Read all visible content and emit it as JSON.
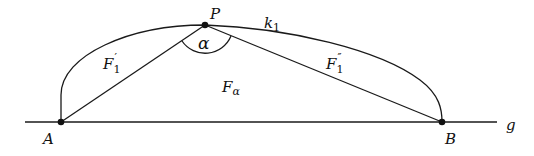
{
  "diagram": {
    "points": {
      "A": "A",
      "B": "B",
      "P": "P"
    },
    "line_label": "g",
    "curve_label": {
      "base": "k",
      "sub": "1"
    },
    "angle_label": "α",
    "area_label": {
      "base": "F",
      "sub": "α"
    },
    "segment_left_label": {
      "base": "F",
      "sub": "1",
      "sup": "′"
    },
    "segment_right_label": {
      "base": "F",
      "sub": "1",
      "sup": "″"
    },
    "colors": {
      "stroke": "#1a1a1a",
      "background": "#ffffff"
    }
  }
}
